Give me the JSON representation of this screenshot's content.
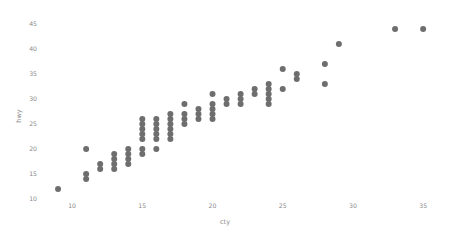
{
  "chart_data": {
    "type": "scatter",
    "title": "",
    "subtitle": "",
    "xlabel": "cty",
    "ylabel": "hwy",
    "xlim": [
      8.0,
      36.2
    ],
    "ylim": [
      10.2,
      46.2
    ],
    "xticks": [
      10,
      15,
      20,
      25,
      30,
      35
    ],
    "yticks": [
      10,
      15,
      20,
      25,
      30,
      35,
      40,
      45
    ],
    "xtick_labels": [
      "10",
      "15",
      "20",
      "25",
      "30",
      "35"
    ],
    "ytick_labels": [
      "10",
      "15",
      "20",
      "25",
      "30",
      "35",
      "40",
      "45"
    ],
    "grid": false,
    "legend": null,
    "legend_position": "none",
    "marker": {
      "shape": "circle",
      "color": "#6e6e6e",
      "size": 3.0,
      "opacity": 1.0
    },
    "annotations": [],
    "series": [
      {
        "name": "mpg",
        "points": [
          [
            18,
            29
          ],
          [
            21,
            29
          ],
          [
            20,
            31
          ],
          [
            21,
            30
          ],
          [
            16,
            26
          ],
          [
            18,
            26
          ],
          [
            18,
            27
          ],
          [
            18,
            26
          ],
          [
            16,
            25
          ],
          [
            20,
            28
          ],
          [
            19,
            27
          ],
          [
            15,
            25
          ],
          [
            17,
            25
          ],
          [
            17,
            25
          ],
          [
            15,
            25
          ],
          [
            15,
            24
          ],
          [
            17,
            25
          ],
          [
            16,
            23
          ],
          [
            14,
            20
          ],
          [
            11,
            15
          ],
          [
            14,
            20
          ],
          [
            13,
            17
          ],
          [
            12,
            17
          ],
          [
            16,
            26
          ],
          [
            15,
            23
          ],
          [
            16,
            26
          ],
          [
            15,
            25
          ],
          [
            15,
            24
          ],
          [
            14,
            19
          ],
          [
            11,
            14
          ],
          [
            11,
            15
          ],
          [
            14,
            17
          ],
          [
            19,
            27
          ],
          [
            22,
            30
          ],
          [
            18,
            26
          ],
          [
            18,
            25
          ],
          [
            17,
            24
          ],
          [
            18,
            25
          ],
          [
            17,
            23
          ],
          [
            16,
            20
          ],
          [
            16,
            20
          ],
          [
            17,
            26
          ],
          [
            17,
            23
          ],
          [
            11,
            20
          ],
          [
            15,
            24
          ],
          [
            15,
            24
          ],
          [
            16,
            26
          ],
          [
            16,
            23
          ],
          [
            15,
            19
          ],
          [
            14,
            19
          ],
          [
            13,
            19
          ],
          [
            13,
            17
          ],
          [
            13,
            17
          ],
          [
            13,
            17
          ],
          [
            14,
            17
          ],
          [
            13,
            16
          ],
          [
            13,
            16
          ],
          [
            13,
            17
          ],
          [
            14,
            17
          ],
          [
            14,
            18
          ],
          [
            13,
            17
          ],
          [
            14,
            19
          ],
          [
            13,
            17
          ],
          [
            13,
            17
          ],
          [
            13,
            17
          ],
          [
            12,
            16
          ],
          [
            16,
            23
          ],
          [
            15,
            23
          ],
          [
            16,
            23
          ],
          [
            15,
            22
          ],
          [
            15,
            23
          ],
          [
            16,
            24
          ],
          [
            14,
            18
          ],
          [
            21,
            29
          ],
          [
            21,
            29
          ],
          [
            21,
            29
          ],
          [
            18,
            26
          ],
          [
            18,
            26
          ],
          [
            21,
            29
          ],
          [
            21,
            29
          ],
          [
            21,
            29
          ],
          [
            18,
            27
          ],
          [
            18,
            26
          ],
          [
            21,
            29
          ],
          [
            18,
            26
          ],
          [
            18,
            26
          ],
          [
            20,
            28
          ],
          [
            21,
            29
          ],
          [
            21,
            29
          ],
          [
            21,
            29
          ],
          [
            18,
            26
          ],
          [
            18,
            26
          ],
          [
            19,
            28
          ],
          [
            19,
            26
          ],
          [
            20,
            28
          ],
          [
            20,
            29
          ],
          [
            17,
            24
          ],
          [
            16,
            24
          ],
          [
            17,
            24
          ],
          [
            17,
            22
          ],
          [
            15,
            19
          ],
          [
            15,
            20
          ],
          [
            14,
            17
          ],
          [
            9,
            12
          ],
          [
            14,
            19
          ],
          [
            13,
            18
          ],
          [
            11,
            14
          ],
          [
            11,
            15
          ],
          [
            12,
            17
          ],
          [
            14,
            17
          ],
          [
            15,
            24
          ],
          [
            13,
            19
          ],
          [
            13,
            19
          ],
          [
            13,
            17
          ],
          [
            14,
            17
          ],
          [
            14,
            17
          ],
          [
            14,
            19
          ],
          [
            13,
            19
          ],
          [
            13,
            19
          ],
          [
            15,
            23
          ],
          [
            13,
            17
          ],
          [
            13,
            17
          ],
          [
            13,
            17
          ],
          [
            13,
            17
          ],
          [
            13,
            17
          ],
          [
            13,
            18
          ],
          [
            14,
            19
          ],
          [
            14,
            19
          ],
          [
            13,
            17
          ],
          [
            13,
            17
          ],
          [
            13,
            16
          ],
          [
            14,
            17
          ],
          [
            14,
            20
          ],
          [
            13,
            17
          ],
          [
            14,
            19
          ],
          [
            11,
            15
          ],
          [
            11,
            15
          ],
          [
            12,
            17
          ],
          [
            12,
            17
          ],
          [
            15,
            20
          ],
          [
            16,
            23
          ],
          [
            14,
            20
          ],
          [
            14,
            19
          ],
          [
            15,
            20
          ],
          [
            15,
            24
          ],
          [
            19,
            27
          ],
          [
            18,
            26
          ],
          [
            18,
            26
          ],
          [
            19,
            26
          ],
          [
            20,
            27
          ],
          [
            20,
            28
          ],
          [
            18,
            26
          ],
          [
            17,
            24
          ],
          [
            17,
            24
          ],
          [
            19,
            26
          ],
          [
            19,
            26
          ],
          [
            17,
            23
          ],
          [
            16,
            22
          ],
          [
            15,
            20
          ],
          [
            18,
            26
          ],
          [
            19,
            27
          ],
          [
            19,
            27
          ],
          [
            17,
            24
          ],
          [
            18,
            26
          ],
          [
            16,
            22
          ],
          [
            17,
            22
          ],
          [
            20,
            26
          ],
          [
            22,
            29
          ],
          [
            23,
            31
          ],
          [
            21,
            29
          ],
          [
            22,
            31
          ],
          [
            23,
            32
          ],
          [
            21,
            29
          ],
          [
            22,
            29
          ],
          [
            21,
            29
          ],
          [
            19,
            28
          ],
          [
            19,
            27
          ],
          [
            24,
            33
          ],
          [
            18,
            26
          ],
          [
            17,
            24
          ],
          [
            20,
            28
          ],
          [
            19,
            26
          ],
          [
            16,
            23
          ],
          [
            17,
            24
          ],
          [
            20,
            28
          ],
          [
            20,
            28
          ],
          [
            21,
            30
          ],
          [
            21,
            29
          ],
          [
            22,
            31
          ],
          [
            24,
            31
          ],
          [
            22,
            29
          ],
          [
            22,
            30
          ],
          [
            23,
            32
          ],
          [
            24,
            33
          ],
          [
            20,
            28
          ],
          [
            21,
            30
          ],
          [
            22,
            29
          ],
          [
            26,
            35
          ],
          [
            33,
            44
          ],
          [
            33,
            44
          ],
          [
            28,
            33
          ],
          [
            35,
            44
          ],
          [
            29,
            41
          ],
          [
            24,
            29
          ],
          [
            28,
            37
          ],
          [
            24,
            33
          ],
          [
            24,
            33
          ],
          [
            22,
            29
          ],
          [
            26,
            34
          ],
          [
            25,
            36
          ],
          [
            25,
            36
          ],
          [
            24,
            32
          ],
          [
            21,
            29
          ],
          [
            25,
            32
          ],
          [
            25,
            32
          ],
          [
            23,
            31
          ],
          [
            21,
            30
          ],
          [
            26,
            35
          ],
          [
            24,
            30
          ],
          [
            20,
            28
          ],
          [
            18,
            26
          ],
          [
            17,
            24
          ],
          [
            16,
            24
          ],
          [
            18,
            26
          ],
          [
            20,
            28
          ],
          [
            18,
            26
          ],
          [
            17,
            25
          ],
          [
            18,
            26
          ],
          [
            16,
            23
          ],
          [
            16,
            26
          ],
          [
            15,
            25
          ],
          [
            15,
            26
          ],
          [
            17,
            26
          ],
          [
            17,
            27
          ],
          [
            16,
            23
          ],
          [
            18,
            26
          ]
        ]
      }
    ]
  },
  "axes": {
    "x_title": "cty",
    "y_title": "hwy"
  },
  "colors": {
    "point": "#6e6e6e",
    "text": "#8a8a8a",
    "background": "#ffffff"
  }
}
